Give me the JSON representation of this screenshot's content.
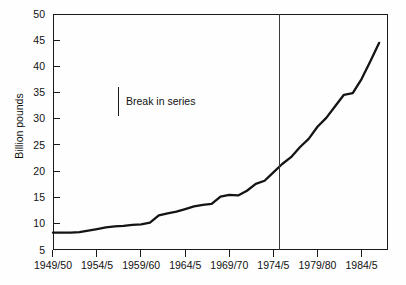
{
  "chart_data": {
    "type": "line",
    "title": "",
    "xlabel": "",
    "ylabel": "Billion pounds",
    "ylim": [
      5,
      50
    ],
    "yticks": [
      5,
      10,
      15,
      20,
      25,
      30,
      35,
      40,
      45,
      50
    ],
    "ytick_labels": [
      "5",
      "10",
      "15",
      "20",
      "25",
      "30",
      "35",
      "40",
      "45",
      "50"
    ],
    "xlim": [
      1949,
      1987
    ],
    "xtick_years": [
      1949,
      1954,
      1959,
      1964,
      1969,
      1974,
      1979,
      1984
    ],
    "xtick_labels": [
      "1949/50",
      "1954/5",
      "1959/60",
      "1964/5",
      "1969/70",
      "1974/5",
      "1979/80",
      "1984/5"
    ],
    "grid": false,
    "legend": null,
    "annotations": [
      {
        "text": "Break in series",
        "year": 1974,
        "rule_top_value": 36.0,
        "rule_bottom_value": 30.6,
        "text_value": 33.4
      }
    ],
    "break_line_year": 1974.6,
    "series": [
      {
        "name": "Billion pounds",
        "x": [
          1949,
          1950,
          1951,
          1952,
          1953,
          1954,
          1955,
          1956,
          1957,
          1958,
          1959,
          1960,
          1961,
          1962,
          1963,
          1964,
          1965,
          1966,
          1967,
          1968,
          1969,
          1970,
          1971,
          1972,
          1973,
          1974,
          1975,
          1976,
          1977,
          1978,
          1979,
          1980,
          1981,
          1982,
          1983,
          1984,
          1985,
          1986
        ],
        "values": [
          8.3,
          8.3,
          8.3,
          8.4,
          8.7,
          9.0,
          9.3,
          9.5,
          9.6,
          9.8,
          9.9,
          10.2,
          11.6,
          12.0,
          12.3,
          12.8,
          13.3,
          13.6,
          13.8,
          15.2,
          15.5,
          15.4,
          16.3,
          17.6,
          18.2,
          19.8,
          21.4,
          22.7,
          24.6,
          26.2,
          28.5,
          30.2,
          32.4,
          34.6,
          34.9,
          37.6,
          41.0,
          44.5
        ]
      }
    ]
  },
  "axis": {
    "y_title": "Billion pounds"
  }
}
